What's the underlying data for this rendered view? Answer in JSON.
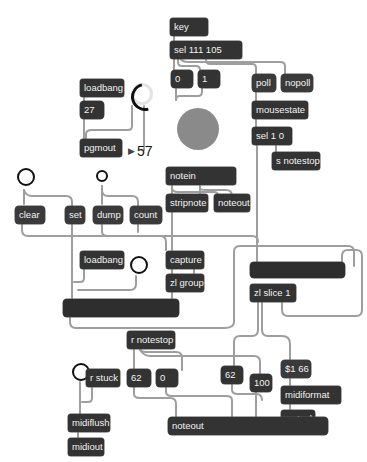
{
  "patcher": {
    "objects": {
      "key": "key",
      "sel_keys": "sel 111 105",
      "msg_0_top": "0",
      "msg_1_top": "1",
      "poll": "poll",
      "nopoll": "nopoll",
      "mousestate": "mousestate",
      "sel_1_0": "sel 1 0",
      "s_notestop": "s notestop",
      "loadbang_top": "loadbang",
      "num_27": "27",
      "pgmout": "pgmout",
      "pgm_display": "57",
      "notein": "notein",
      "stripnote": "stripnote",
      "noteout_mid": "noteout",
      "clear": "clear",
      "set": "set",
      "dump": "dump",
      "count": "count",
      "loadbang_mid": "loadbang",
      "capture": "capture",
      "zl_group": "zl group",
      "zl_slice": "zl slice 1",
      "r_notestop": "r notestop",
      "num_62_a": "62",
      "num_0_b": "0",
      "num_62_b": "62",
      "num_100": "100",
      "msg_66": "$1 66",
      "midiformat": "midiformat",
      "s_stuck": "s stuck",
      "r_stuck": "r stuck",
      "midiflush": "midiflush",
      "midiout": "midiout",
      "noteout_bottom": "noteout"
    },
    "colors": {
      "object_bg": "#333333",
      "object_text": "#f2f2f2",
      "patch_cord": "#9e9e9e",
      "led_ball": "#8a8a8a",
      "background": "#ffffff"
    }
  }
}
